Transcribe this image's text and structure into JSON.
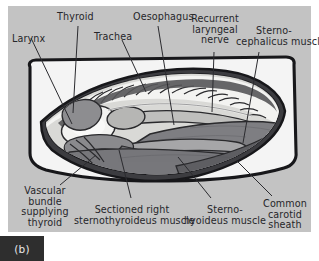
{
  "figure": {
    "caption": "(b)",
    "panel_bg": "#c3c3c3",
    "caption_bg": "#2e2e2e",
    "ink": "#26262a"
  },
  "labels": [
    {
      "id": "larynx",
      "text": "Larynx",
      "align": "left"
    },
    {
      "id": "thyroid",
      "text": "Thyroid",
      "align": "left"
    },
    {
      "id": "trachea",
      "text": "Trachea",
      "align": "left"
    },
    {
      "id": "oesophagus",
      "text": "Oesophagus",
      "align": "left"
    },
    {
      "id": "recurrent-nerve",
      "text": "Recurrent\nlaryngeal\nnerve",
      "align": "right"
    },
    {
      "id": "sternocephalicus",
      "text": "Sterno-\ncephalicus muscle",
      "align": "left"
    },
    {
      "id": "vascular-bundle",
      "text": "Vascular\nbundle\nsupplying\nthyroid",
      "align": "right"
    },
    {
      "id": "sectioned-sternothyroideus",
      "text": "Sectioned right\nsternothyroideus muscle",
      "align": "center"
    },
    {
      "id": "sternohyoideus",
      "text": "Sterno-\nhyoideus muscle",
      "align": "center"
    },
    {
      "id": "carotid-sheath",
      "text": "Common\ncarotid\nsheath",
      "align": "center"
    }
  ],
  "anatomy_parts": [
    "drape-field",
    "incision-opening",
    "tracheal-rings",
    "laryngeal-body",
    "thyroid-lobe",
    "oesophagus-tube",
    "recurrent-laryngeal-nerve",
    "sternocephalicus-muscle",
    "sternohyoideus-muscle",
    "sternothyroideus-muscle-cut",
    "common-carotid-sheath",
    "vascular-bundle"
  ]
}
